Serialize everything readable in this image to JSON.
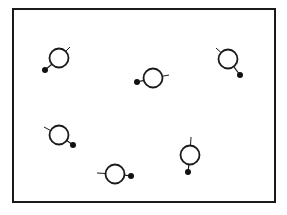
{
  "diagram": {
    "type": "molecule-arrangement",
    "colors": {
      "stroke": "#1a1a1a",
      "dot": "#111111",
      "background": "#ffffff"
    },
    "frame": {
      "x": 13,
      "y": 9,
      "width": 262,
      "height": 193
    },
    "circle_radius": 9.5,
    "dot_radius": 3,
    "molecules": [
      {
        "id": 1,
        "cx": 59,
        "cy": 58,
        "dot": [
          45,
          70
        ],
        "tail": [
          70,
          47
        ]
      },
      {
        "id": 2,
        "cx": 153,
        "cy": 78,
        "dot": [
          137,
          82
        ],
        "tail": [
          169,
          75
        ]
      },
      {
        "id": 3,
        "cx": 228,
        "cy": 59,
        "dot": [
          240,
          75
        ],
        "tail": [
          216,
          48
        ]
      },
      {
        "id": 4,
        "cx": 59,
        "cy": 135,
        "dot": [
          73,
          145
        ],
        "tail": [
          44,
          127
        ]
      },
      {
        "id": 5,
        "cx": 115,
        "cy": 174,
        "dot": [
          131,
          176
        ],
        "tail": [
          97,
          173
        ]
      },
      {
        "id": 6,
        "cx": 190,
        "cy": 155,
        "dot": [
          188,
          172
        ],
        "tail": [
          191,
          137
        ]
      }
    ]
  }
}
